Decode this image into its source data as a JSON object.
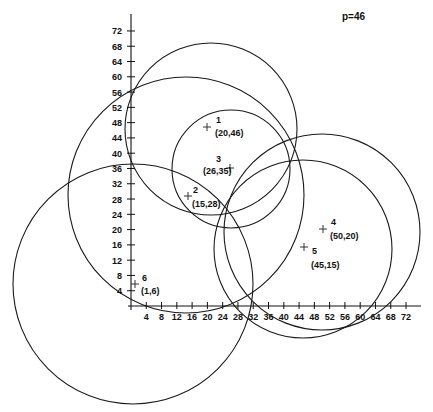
{
  "header": {
    "parameter_label": "p=46"
  },
  "axes": {
    "x_ticks": [
      "4",
      "8",
      "12",
      "16",
      "20",
      "24",
      "28",
      "32",
      "36",
      "40",
      "44",
      "48",
      "52",
      "56",
      "60",
      "64",
      "68",
      "72"
    ],
    "y_ticks": [
      "4",
      "8",
      "12",
      "16",
      "20",
      "24",
      "28",
      "32",
      "36",
      "40",
      "44",
      "48",
      "52",
      "56",
      "60",
      "64",
      "68",
      "72"
    ]
  },
  "points": [
    {
      "id": "1",
      "coords": "(20,46)",
      "x": 20,
      "y": 46
    },
    {
      "id": "2",
      "coords": "(15,28)",
      "x": 15,
      "y": 28
    },
    {
      "id": "3",
      "coords": "(26,35)",
      "x": 26,
      "y": 35
    },
    {
      "id": "4",
      "coords": "(50,20)",
      "x": 50,
      "y": 20
    },
    {
      "id": "5",
      "coords": "(45,15)",
      "x": 45,
      "y": 15
    },
    {
      "id": "6",
      "coords": "(1,6)",
      "x": 1,
      "y": 6
    }
  ],
  "circles": [
    {
      "center_point": "1",
      "radius_units": 22.5
    },
    {
      "center_point": "2",
      "radius_units": 30.5
    },
    {
      "center_point": "3",
      "radius_units": 15.5
    },
    {
      "center_point": "4",
      "radius_units": 25.5
    },
    {
      "center_point": "5",
      "radius_units": 23.5
    },
    {
      "center_point": "6",
      "radius_units": 31.5
    }
  ],
  "colors": {
    "ink": "#111111",
    "background": "#ffffff"
  }
}
